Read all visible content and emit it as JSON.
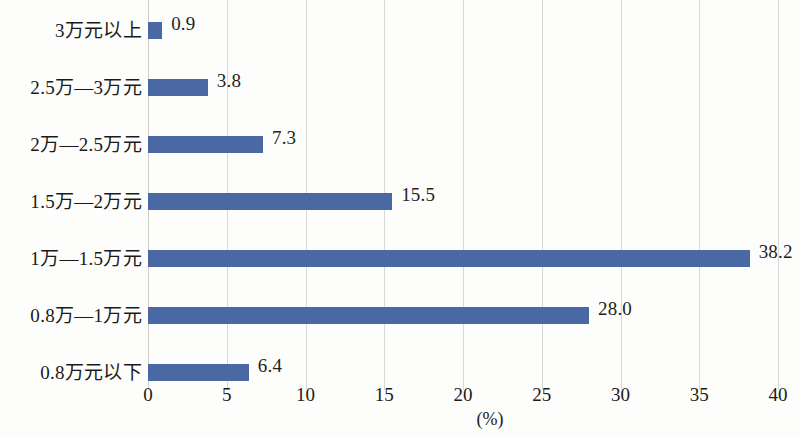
{
  "chart_data": {
    "type": "bar",
    "orientation": "horizontal",
    "title": "",
    "subtitle": "",
    "xlabel": "(%)",
    "ylabel": "",
    "xlim": [
      0,
      40
    ],
    "xticks": [
      "0",
      "5",
      "10",
      "15",
      "20",
      "25",
      "30",
      "35",
      "40"
    ],
    "grid": "vertical",
    "legend": "none",
    "bar_color": "#4a68a4",
    "gridline_color": "#d8d8d6",
    "categories": [
      "3万元以上",
      "2.5万—3万元",
      "2万—2.5万元",
      "1.5万—2万元",
      "1万—1.5万元",
      "0.8万—1万元",
      "0.8万元以下"
    ],
    "values": [
      0.9,
      3.8,
      7.3,
      15.5,
      38.2,
      28.0,
      6.4
    ],
    "value_labels": [
      "0.9",
      "3.8",
      "7.3",
      "15.5",
      "38.2",
      "28.0",
      "6.4"
    ]
  }
}
